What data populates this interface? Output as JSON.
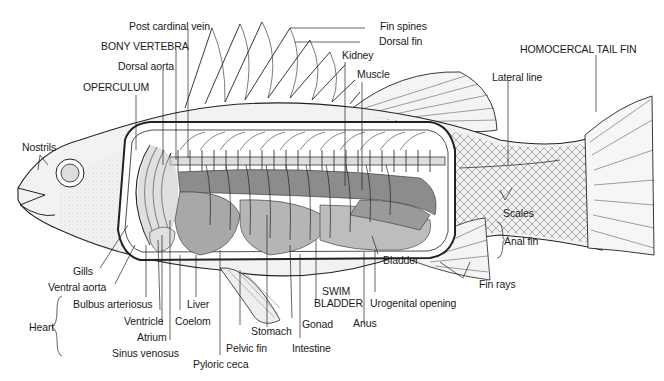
{
  "diagram": {
    "labels": {
      "post_cardinal_vein": "Post cardinal vein",
      "bony_vertebra": "BONY VERTEBRA",
      "dorsal_aorta": "Dorsal aorta",
      "operculum": "OPERCULUM",
      "nostrils": "Nostrils",
      "fin_spines": "Fin spines",
      "dorsal_fin": "Dorsal fin",
      "kidney": "Kidney",
      "muscle": "Muscle",
      "homocercal_tail_fin": "HOMOCERCAL TAIL FIN",
      "lateral_line": "Lateral line",
      "scales": "Scales",
      "anal_fin": "Anal fin",
      "fin_rays": "Fin rays",
      "bladder": "Bladder",
      "urogenital_opening": "Urogenital opening",
      "swim_bladder_1": "SWIM",
      "swim_bladder_2": "BLADDER",
      "anus": "Anus",
      "gonad": "Gonad",
      "intestine": "Intestine",
      "stomach": "Stomach",
      "pelvic_fin": "Pelvic fin",
      "pyloric_ceca": "Pyloric ceca",
      "liver": "Liver",
      "coelom": "Coelom",
      "gills": "Gills",
      "ventral_aorta": "Ventral aorta",
      "bulbus_arteriosus": "Bulbus arteriosus",
      "ventricle": "Ventricle",
      "atrium": "Atrium",
      "sinus_venosus": "Sinus venosus",
      "heart": "Heart"
    },
    "colors": {
      "line": "#1a1a1a",
      "organ_dark": "#8c8c8c",
      "organ_mid": "#a8a8a8",
      "organ_light": "#c4c4c4",
      "body_stipple": "#e6e6e6"
    }
  }
}
